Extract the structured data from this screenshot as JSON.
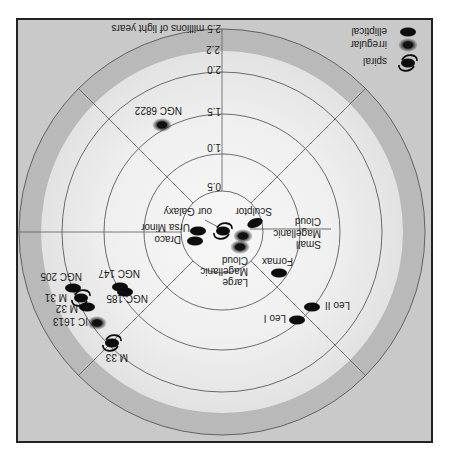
{
  "diagram": {
    "orientation": "rotated 180 degrees (upside down)",
    "legend": {
      "elliptical": "elliptical",
      "irregular": "irregular",
      "spiral": "spiral"
    },
    "axis": {
      "unit_label": "2.5 millions of light years",
      "ticks": [
        "0.5",
        "1.0",
        "1.5",
        "2.0",
        "2.2"
      ]
    },
    "galaxies": {
      "our_galaxy": {
        "name": "our Galaxy",
        "type": "spiral"
      },
      "sculptor": {
        "name": "Sculptor",
        "type": "elliptical"
      },
      "ursa_minor": {
        "name": "Ursa Minor",
        "type": "elliptical"
      },
      "draco": {
        "name": "Draco",
        "type": "elliptical"
      },
      "smc": {
        "lines": [
          "Small",
          "Magellanic",
          "Cloud"
        ],
        "type": "irregular"
      },
      "lmc": {
        "lines": [
          "Large",
          "Magellanic",
          "Cloud"
        ],
        "type": "irregular"
      },
      "fornax": {
        "name": "Fornax",
        "type": "elliptical"
      },
      "leo_ii": {
        "name": "Leo II",
        "type": "elliptical"
      },
      "leo_i": {
        "name": "Leo I",
        "type": "elliptical"
      },
      "ngc6822": {
        "name": "NGC 6822",
        "type": "irregular"
      },
      "ngc147": {
        "name": "NGC 147",
        "type": "elliptical"
      },
      "ngc185": {
        "name": "NGC 185",
        "type": "elliptical"
      },
      "ngc205": {
        "name": "NGC 205",
        "type": "elliptical"
      },
      "m31": {
        "name": "M 31",
        "type": "spiral"
      },
      "m32": {
        "name": "M 32",
        "type": "elliptical"
      },
      "ic1613": {
        "name": "IC 1613",
        "type": "irregular"
      },
      "m33": {
        "name": "M 33",
        "type": "spiral"
      }
    },
    "colors": {
      "outer": "#c9c9c9",
      "band": "#b9b9b9",
      "inner": "#f2f2f2",
      "ink": "#111111"
    }
  }
}
